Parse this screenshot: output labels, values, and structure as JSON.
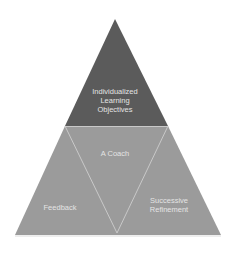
{
  "diagram": {
    "type": "pyramid",
    "colors": {
      "background": "#ffffff",
      "top_section": "#5b5b5b",
      "bottom_sections": "#9b9b9b",
      "divider_lines": "#c9c9c9",
      "text": "#e4e4e4"
    },
    "sections": {
      "top": {
        "label": "Individualized\nLearning\nObjectives"
      },
      "center": {
        "label": "A Coach"
      },
      "bottom_left": {
        "label": "Feedback"
      },
      "bottom_right": {
        "label": "Successive\nRefinement"
      }
    }
  }
}
